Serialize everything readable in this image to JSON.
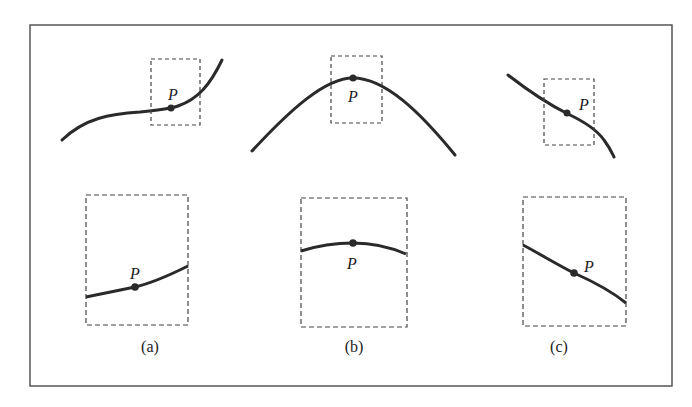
{
  "figure": {
    "panels": [
      {
        "id": "a",
        "caption": "(a)",
        "point_label": "P",
        "description": "Inflecting increasing curve; zoomed view nearly straight"
      },
      {
        "id": "b",
        "caption": "(b)",
        "point_label": "P",
        "description": "Concave-down arch with P at the peak; zoomed view nearly flat"
      },
      {
        "id": "c",
        "caption": "(c)",
        "point_label": "P",
        "description": "Decreasing curve; zoomed view nearly straight line sloping down"
      }
    ],
    "colors": {
      "curve": "#2a2a2a",
      "frame": "#555555",
      "dash": "#444444",
      "text": "#222222"
    }
  }
}
